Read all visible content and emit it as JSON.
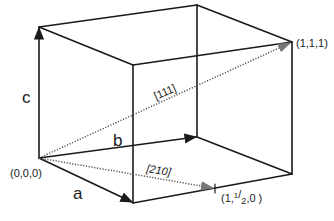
{
  "diagram": {
    "type": "unit-cell-crystallographic-directions",
    "axes": {
      "a": "a",
      "b": "b",
      "c": "c"
    },
    "points": {
      "origin": "(0,0,0)",
      "corner_111": "(1,1,1)",
      "point_1_half_0": {
        "prefix": "(1,",
        "num": "1",
        "slash": "/",
        "den": "2",
        "suffix": ",0 )"
      }
    },
    "directions": {
      "d111": "[111]",
      "d210": "[210]"
    },
    "colors": {
      "edge": "#1a1a1a",
      "vector": "#555555",
      "background": "#ffffff"
    }
  }
}
